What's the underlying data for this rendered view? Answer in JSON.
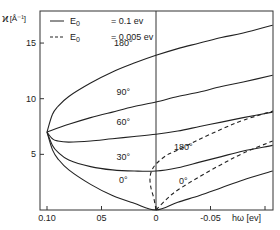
{
  "chart_data": {
    "type": "line",
    "title": "",
    "xlabel": "hω [ev]",
    "ylabel": "ϰ [Å⁻¹]",
    "xlim": [
      0.1,
      -0.107
    ],
    "ylim": [
      0,
      18
    ],
    "x_ticks": [
      {
        "value": 0.1,
        "label": "0.10"
      },
      {
        "value": 0.05,
        "label": "05"
      },
      {
        "value": 0.0,
        "label": "0"
      },
      {
        "value": -0.05,
        "label": "-0.05"
      },
      {
        "value": -0.1,
        "label": ""
      }
    ],
    "y_ticks": [
      {
        "value": 5,
        "label": "5"
      },
      {
        "value": 10,
        "label": "10"
      },
      {
        "value": 15,
        "label": "15"
      }
    ],
    "grid": false,
    "reference_line_x": 0,
    "legend": {
      "position": "top-left",
      "entries": [
        {
          "style": "solid",
          "symbol": "E",
          "subscript": "0",
          "value": "= 0.1 ev"
        },
        {
          "style": "dashed",
          "symbol": "E",
          "subscript": "0",
          "value": "= 0.005 ev"
        }
      ]
    },
    "series": [
      {
        "name": "180°",
        "group": "E0 = 0.1 ev",
        "style": "solid",
        "x": [
          0.1,
          0.095,
          0.09,
          0.08,
          0.06,
          0.04,
          0.02,
          0.0,
          -0.02,
          -0.04,
          -0.06,
          -0.08,
          -0.107
        ],
        "y": [
          7.0,
          8.6,
          9.3,
          10.2,
          11.4,
          12.4,
          13.2,
          13.9,
          14.5,
          15.0,
          15.5,
          15.9,
          16.6
        ]
      },
      {
        "name": "90°",
        "group": "E0 = 0.1 ev",
        "style": "solid",
        "x": [
          0.1,
          0.08,
          0.06,
          0.04,
          0.02,
          0.0,
          -0.02,
          -0.04,
          -0.06,
          -0.08,
          -0.107
        ],
        "y": [
          7.0,
          7.7,
          8.3,
          8.8,
          9.3,
          9.7,
          10.2,
          10.6,
          11.1,
          11.5,
          12.1
        ]
      },
      {
        "name": "60°",
        "group": "E0 = 0.1 ev",
        "style": "solid",
        "x": [
          0.1,
          0.095,
          0.09,
          0.08,
          0.06,
          0.04,
          0.02,
          0.0,
          -0.02,
          -0.04,
          -0.06,
          -0.08,
          -0.107
        ],
        "y": [
          7.0,
          6.4,
          6.2,
          6.1,
          6.2,
          6.4,
          6.6,
          6.8,
          7.1,
          7.5,
          7.9,
          8.3,
          8.8
        ]
      },
      {
        "name": "30°",
        "group": "E0 = 0.1 ev",
        "style": "solid",
        "x": [
          0.1,
          0.095,
          0.09,
          0.08,
          0.06,
          0.04,
          0.02,
          0.0,
          -0.02,
          -0.04,
          -0.06,
          -0.08,
          -0.107
        ],
        "y": [
          7.0,
          5.8,
          5.2,
          4.5,
          3.9,
          3.6,
          3.5,
          3.5,
          3.8,
          4.3,
          4.8,
          5.3,
          5.8
        ]
      },
      {
        "name": "0°",
        "group": "E0 = 0.1 ev",
        "style": "solid",
        "x": [
          0.1,
          0.095,
          0.09,
          0.08,
          0.06,
          0.04,
          0.02,
          0.0,
          -0.02,
          -0.04,
          -0.06,
          -0.08,
          -0.107
        ],
        "y": [
          7.0,
          5.4,
          4.6,
          3.6,
          2.3,
          1.3,
          0.6,
          0.0,
          0.7,
          1.3,
          2.0,
          2.7,
          3.5
        ]
      },
      {
        "name": "180°",
        "group": "E0 = 0.005 ev",
        "style": "dashed",
        "x": [
          0.0,
          0.001,
          0.003,
          0.006,
          0.01,
          0.0,
          -0.01,
          -0.02,
          -0.04,
          -0.06,
          -0.08,
          -0.107
        ],
        "y": [
          0.0,
          1.0,
          2.0,
          2.8,
          3.4,
          3.6,
          4.6,
          5.3,
          6.4,
          7.3,
          8.1,
          8.9
        ]
      },
      {
        "name": "0°",
        "group": "E0 = 0.005 ev",
        "style": "dashed",
        "x": [
          0.0,
          -0.01,
          -0.02,
          -0.04,
          -0.06,
          -0.08,
          -0.107
        ],
        "y": [
          0.0,
          1.0,
          1.8,
          3.0,
          4.1,
          5.1,
          6.2
        ]
      }
    ],
    "annotations": [
      {
        "text": "180°",
        "x": 0.03,
        "y": 14.7
      },
      {
        "text": "90°",
        "x": 0.03,
        "y": 10.3
      },
      {
        "text": "60°",
        "x": 0.03,
        "y": 7.6
      },
      {
        "text": "30°",
        "x": 0.03,
        "y": 4.5
      },
      {
        "text": "0°",
        "x": 0.03,
        "y": 2.4
      },
      {
        "text": "180°",
        "x": -0.025,
        "y": 5.4
      },
      {
        "text": "0°",
        "x": -0.025,
        "y": 2.3
      }
    ]
  },
  "legend": {
    "solid_symbol": "E",
    "solid_sub": "0",
    "solid_value": "= 0.1 ev",
    "dashed_symbol": "E",
    "dashed_sub": "0",
    "dashed_value": "= 0.005 ev"
  },
  "axes": {
    "y_label_main": "ϰ",
    "y_label_unit": "[Å⁻¹]",
    "x_label": "hω [ev]"
  },
  "colors": {
    "line": "#222222",
    "frame": "#333333",
    "background": "#ffffff"
  }
}
